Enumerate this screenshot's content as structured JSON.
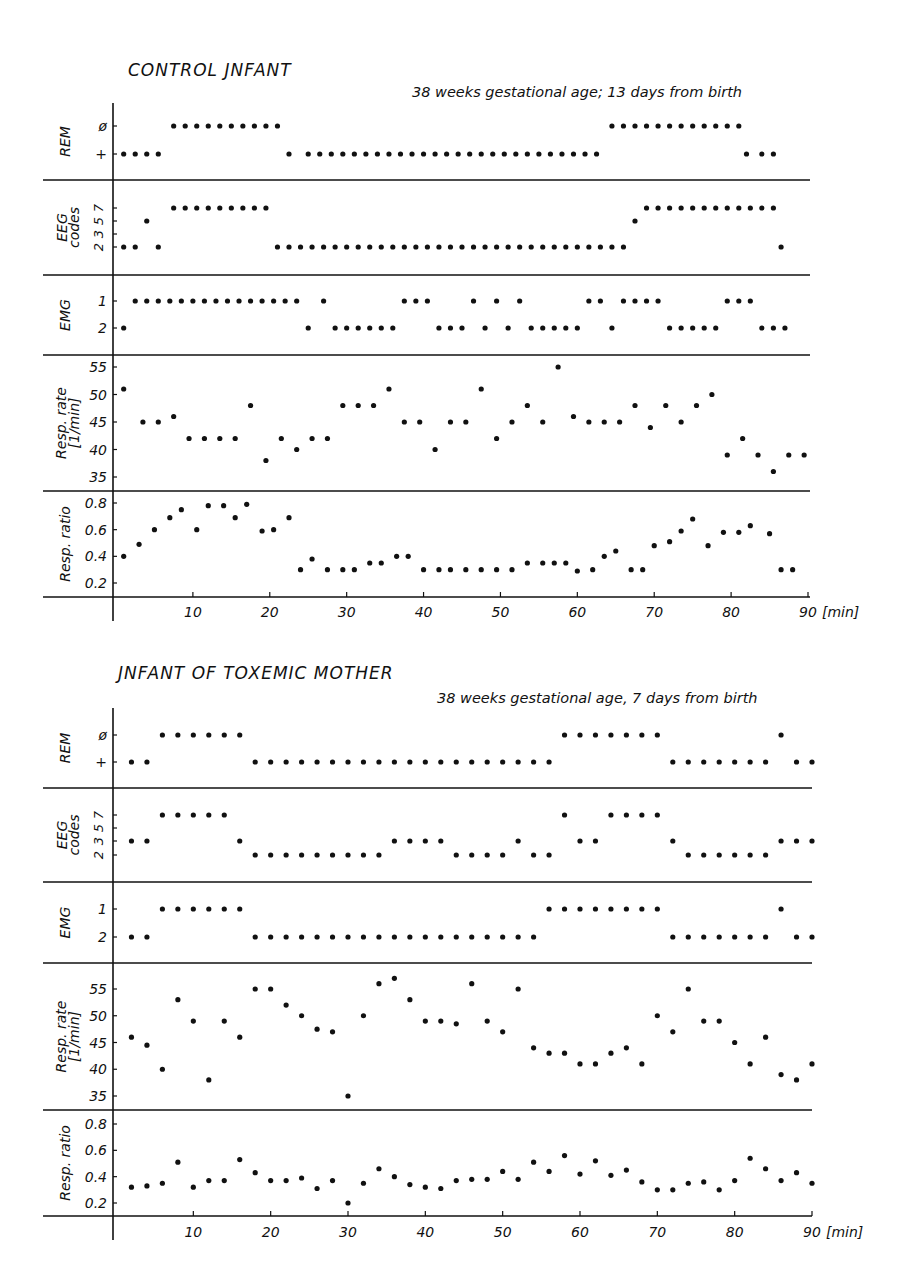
{
  "figure": {
    "top": {
      "title": "CONTROL JNFANT",
      "subtitle": "38 weeks gestational age; 13 days from birth"
    },
    "bottom": {
      "title": "JNFANT OF TOXEMIC MOTHER",
      "subtitle": "38 weeks gestational age, 7 days from birth"
    }
  },
  "chart_data": [
    {
      "type": "scatter",
      "title": "CONTROL JNFANT",
      "subtitle": "38 weeks gestational age; 13 days from birth",
      "xlabel": "[min]",
      "xlim": [
        0,
        90
      ],
      "xticks": [
        10,
        20,
        30,
        40,
        50,
        60,
        70,
        80,
        90
      ],
      "grid": false,
      "panels": [
        {
          "name": "REM",
          "ylabel": "REM",
          "yticks": [
            "+",
            "ø"
          ],
          "x": [
            1,
            2.5,
            4,
            5.5,
            7.5,
            9,
            10.5,
            12,
            13.5,
            15,
            16.5,
            18,
            19.5,
            21,
            22.5,
            25,
            26.5,
            28,
            29.5,
            31,
            32.5,
            34,
            35.5,
            37,
            38.5,
            40,
            41.5,
            43,
            44.5,
            46,
            47.5,
            49,
            50.5,
            52,
            53.5,
            55,
            56.5,
            58,
            59.5,
            61,
            62.5,
            64.5,
            66,
            67.5,
            69,
            70.5,
            72,
            73.5,
            75,
            76.5,
            78,
            79.5,
            81,
            82,
            84,
            85.5
          ],
          "values": [
            "+",
            "+",
            "+",
            "+",
            "ø",
            "ø",
            "ø",
            "ø",
            "ø",
            "ø",
            "ø",
            "ø",
            "ø",
            "ø",
            "+",
            "+",
            "+",
            "+",
            "+",
            "+",
            "+",
            "+",
            "+",
            "+",
            "+",
            "+",
            "+",
            "+",
            "+",
            "+",
            "+",
            "+",
            "+",
            "+",
            "+",
            "+",
            "+",
            "+",
            "+",
            "+",
            "+",
            "ø",
            "ø",
            "ø",
            "ø",
            "ø",
            "ø",
            "ø",
            "ø",
            "ø",
            "ø",
            "ø",
            "ø",
            "+",
            "+",
            "+"
          ]
        },
        {
          "name": "EEG codes",
          "ylabel": "EEG codes",
          "yticks": [
            "2",
            "3",
            "5",
            "7"
          ],
          "x": [
            1,
            2.5,
            4,
            5.5,
            7.5,
            9,
            10.5,
            12,
            13.5,
            15,
            16.5,
            18,
            19.5,
            21,
            22.5,
            24,
            25.5,
            27,
            28.5,
            30,
            31.5,
            33,
            34.5,
            36,
            37.5,
            39,
            40.5,
            42,
            43.5,
            45,
            46.5,
            48,
            49.5,
            51,
            52.5,
            54,
            55.5,
            57,
            58.5,
            60,
            61.5,
            63,
            64.5,
            66,
            67.5,
            69,
            70.5,
            72,
            73.5,
            75,
            76.5,
            78,
            79.5,
            81,
            82.5,
            84,
            85.5,
            86.5
          ],
          "values": [
            2,
            2,
            5,
            2,
            7,
            7,
            7,
            7,
            7,
            7,
            7,
            7,
            7,
            2,
            2,
            2,
            2,
            2,
            2,
            2,
            2,
            2,
            2,
            2,
            2,
            2,
            2,
            2,
            2,
            2,
            2,
            2,
            2,
            2,
            2,
            2,
            2,
            2,
            2,
            2,
            2,
            2,
            2,
            2,
            5,
            7,
            7,
            7,
            7,
            7,
            7,
            7,
            7,
            7,
            7,
            7,
            7,
            2
          ]
        },
        {
          "name": "EMG",
          "ylabel": "EMG",
          "yticks": [
            "2",
            "1"
          ],
          "x": [
            1,
            2.5,
            4,
            5.5,
            7,
            8.5,
            10,
            11.5,
            13,
            14.5,
            16,
            17.5,
            19,
            20.5,
            22,
            23.5,
            25,
            27,
            28.5,
            30,
            31.5,
            33,
            34.5,
            36,
            37.5,
            39,
            40.5,
            42,
            43.5,
            45,
            46.5,
            48,
            49.5,
            51,
            52.5,
            54,
            55.5,
            57,
            58.5,
            60,
            61.5,
            63,
            64.5,
            66,
            67.5,
            69,
            70.5,
            72,
            73.5,
            75,
            76.5,
            78,
            79.5,
            81,
            82.5,
            84,
            85.5,
            87
          ],
          "values": [
            2,
            1,
            1,
            1,
            1,
            1,
            1,
            1,
            1,
            1,
            1,
            1,
            1,
            1,
            1,
            1,
            2,
            1,
            2,
            2,
            2,
            2,
            2,
            2,
            1,
            1,
            1,
            2,
            2,
            2,
            1,
            2,
            1,
            2,
            1,
            2,
            2,
            2,
            2,
            2,
            1,
            1,
            2,
            1,
            1,
            1,
            1,
            2,
            2,
            2,
            2,
            2,
            1,
            1,
            1,
            2,
            2,
            2
          ]
        },
        {
          "name": "Resp. rate",
          "ylabel": "Resp. rate [1/min]",
          "ylim": [
            33,
            57
          ],
          "yticks": [
            35,
            40,
            45,
            50,
            55
          ],
          "x": [
            1,
            3.5,
            5.5,
            7.5,
            9.5,
            11.5,
            13.5,
            15.5,
            17.5,
            19.5,
            21.5,
            23.5,
            25.5,
            27.5,
            29.5,
            31.5,
            33.5,
            35.5,
            37.5,
            39.5,
            41.5,
            43.5,
            45.5,
            47.5,
            49.5,
            51.5,
            53.5,
            55.5,
            57.5,
            59.5,
            61.5,
            63.5,
            65.5,
            67.5,
            69.5,
            71.5,
            73.5,
            75.5,
            77.5,
            79.5,
            81.5,
            83.5,
            85.5,
            87.5,
            89.5
          ],
          "values": [
            51,
            45,
            45,
            46,
            42,
            42,
            42,
            42,
            48,
            38,
            42,
            40,
            42,
            42,
            48,
            48,
            48,
            51,
            45,
            45,
            40,
            45,
            45,
            51,
            42,
            45,
            48,
            45,
            55,
            46,
            45,
            45,
            45,
            48,
            44,
            48,
            45,
            48,
            50,
            39,
            42,
            39,
            36,
            39,
            39
          ]
        },
        {
          "name": "Resp. ratio",
          "ylabel": "Resp. ratio",
          "ylim": [
            0.1,
            0.9
          ],
          "yticks": [
            0.2,
            0.4,
            0.6,
            0.8
          ],
          "x": [
            1,
            3,
            5,
            7,
            8.5,
            10.5,
            12,
            14,
            15.5,
            17,
            19,
            20.5,
            22.5,
            24,
            25.5,
            27.5,
            29.5,
            31,
            33,
            34.5,
            36.5,
            38,
            40,
            42,
            43.5,
            45.5,
            47.5,
            49.5,
            51.5,
            53.5,
            55.5,
            57,
            58.5,
            60,
            62,
            63.5,
            65,
            67,
            68.5,
            70,
            72,
            73.5,
            75,
            77,
            79,
            81,
            82.5,
            85,
            86.5,
            88
          ],
          "values": [
            0.4,
            0.49,
            0.6,
            0.69,
            0.75,
            0.6,
            0.78,
            0.78,
            0.69,
            0.79,
            0.59,
            0.6,
            0.69,
            0.3,
            0.38,
            0.3,
            0.3,
            0.3,
            0.35,
            0.35,
            0.4,
            0.4,
            0.3,
            0.3,
            0.3,
            0.3,
            0.3,
            0.3,
            0.3,
            0.35,
            0.35,
            0.35,
            0.35,
            0.29,
            0.3,
            0.4,
            0.44,
            0.3,
            0.3,
            0.48,
            0.51,
            0.59,
            0.68,
            0.48,
            0.58,
            0.58,
            0.63,
            0.57,
            0.3,
            0.3
          ]
        }
      ]
    },
    {
      "type": "scatter",
      "title": "JNFANT OF TOXEMIC MOTHER",
      "subtitle": "38 weeks gestational age, 7 days from birth",
      "xlabel": "[min]",
      "xlim": [
        0,
        90
      ],
      "xticks": [
        10,
        20,
        30,
        40,
        50,
        60,
        70,
        80,
        90
      ],
      "grid": false,
      "panels": [
        {
          "name": "REM",
          "ylabel": "REM",
          "yticks": [
            "+",
            "ø"
          ],
          "x": [
            2,
            4,
            6,
            8,
            10,
            12,
            14,
            16,
            18,
            20,
            22,
            24,
            26,
            28,
            30,
            32,
            34,
            36,
            38,
            40,
            42,
            44,
            46,
            48,
            50,
            52,
            54,
            56,
            58,
            60,
            62,
            64,
            66,
            68,
            70,
            72,
            74,
            76,
            78,
            80,
            82,
            84,
            86,
            88,
            90
          ],
          "values": [
            "+",
            "+",
            "ø",
            "ø",
            "ø",
            "ø",
            "ø",
            "ø",
            "+",
            "+",
            "+",
            "+",
            "+",
            "+",
            "+",
            "+",
            "+",
            "+",
            "+",
            "+",
            "+",
            "+",
            "+",
            "+",
            "+",
            "+",
            "+",
            "+",
            "ø",
            "ø",
            "ø",
            "ø",
            "ø",
            "ø",
            "ø",
            "+",
            "+",
            "+",
            "+",
            "+",
            "+",
            "+",
            "ø",
            "+",
            "+"
          ]
        },
        {
          "name": "EEG codes",
          "ylabel": "EEG codes",
          "yticks": [
            "2",
            "3",
            "5",
            "7"
          ],
          "x": [
            2,
            4,
            6,
            8,
            10,
            12,
            14,
            16,
            18,
            20,
            22,
            24,
            26,
            28,
            30,
            32,
            34,
            36,
            38,
            40,
            42,
            44,
            46,
            48,
            50,
            52,
            54,
            56,
            58,
            60,
            62,
            64,
            66,
            68,
            70,
            72,
            74,
            76,
            78,
            80,
            82,
            84,
            86,
            88,
            90
          ],
          "values": [
            3,
            3,
            7,
            7,
            7,
            7,
            7,
            3,
            2,
            2,
            2,
            2,
            2,
            2,
            2,
            2,
            2,
            3,
            3,
            3,
            3,
            2,
            2,
            2,
            2,
            3,
            2,
            2,
            7,
            3,
            3,
            7,
            7,
            7,
            7,
            3,
            2,
            2,
            2,
            2,
            2,
            2,
            3,
            3,
            3
          ]
        },
        {
          "name": "EMG",
          "ylabel": "EMG",
          "yticks": [
            "2",
            "1"
          ],
          "x": [
            2,
            4,
            6,
            8,
            10,
            12,
            14,
            16,
            18,
            20,
            22,
            24,
            26,
            28,
            30,
            32,
            34,
            36,
            38,
            40,
            42,
            44,
            46,
            48,
            50,
            52,
            54,
            56,
            58,
            60,
            62,
            64,
            66,
            68,
            70,
            72,
            74,
            76,
            78,
            80,
            82,
            84,
            86,
            88,
            90
          ],
          "values": [
            2,
            2,
            1,
            1,
            1,
            1,
            1,
            1,
            2,
            2,
            2,
            2,
            2,
            2,
            2,
            2,
            2,
            2,
            2,
            2,
            2,
            2,
            2,
            2,
            2,
            2,
            2,
            1,
            1,
            1,
            1,
            1,
            1,
            1,
            1,
            2,
            2,
            2,
            2,
            2,
            2,
            2,
            1,
            2,
            2
          ]
        },
        {
          "name": "Resp. rate",
          "ylabel": "Resp. rate [1/min]",
          "ylim": [
            33,
            60
          ],
          "yticks": [
            35,
            40,
            45,
            50,
            55
          ],
          "x": [
            2,
            4,
            6,
            8,
            10,
            12,
            14,
            16,
            18,
            20,
            22,
            24,
            26,
            28,
            30,
            32,
            34,
            36,
            38,
            40,
            42,
            44,
            46,
            48,
            50,
            52,
            54,
            56,
            58,
            60,
            62,
            64,
            66,
            68,
            70,
            72,
            74,
            76,
            78,
            80,
            82,
            84,
            86,
            88,
            90
          ],
          "values": [
            46,
            44.5,
            40,
            53,
            49,
            38,
            49,
            46,
            55,
            55,
            52,
            50,
            47.5,
            47,
            35,
            50,
            56,
            57,
            53,
            49,
            49,
            48.5,
            56,
            49,
            47,
            55,
            44,
            43,
            43,
            41,
            41,
            43,
            44,
            41,
            50,
            47,
            55,
            49,
            49,
            45,
            41,
            46,
            39,
            38,
            41
          ]
        },
        {
          "name": "Resp. ratio",
          "ylabel": "Resp. ratio",
          "ylim": [
            0.1,
            0.9
          ],
          "yticks": [
            0.2,
            0.4,
            0.6,
            0.8
          ],
          "x": [
            2,
            4,
            6,
            8,
            10,
            12,
            14,
            16,
            18,
            20,
            22,
            24,
            26,
            28,
            30,
            32,
            34,
            36,
            38,
            40,
            42,
            44,
            46,
            48,
            50,
            52,
            54,
            56,
            58,
            60,
            62,
            64,
            66,
            68,
            70,
            72,
            74,
            76,
            78,
            80,
            82,
            84,
            86,
            88,
            90
          ],
          "values": [
            0.32,
            0.33,
            0.35,
            0.51,
            0.32,
            0.37,
            0.37,
            0.53,
            0.43,
            0.37,
            0.37,
            0.39,
            0.31,
            0.37,
            0.2,
            0.35,
            0.46,
            0.4,
            0.34,
            0.32,
            0.31,
            0.37,
            0.38,
            0.38,
            0.44,
            0.38,
            0.51,
            0.44,
            0.56,
            0.42,
            0.52,
            0.41,
            0.45,
            0.36,
            0.3,
            0.3,
            0.35,
            0.36,
            0.3,
            0.37,
            0.54,
            0.46,
            0.37,
            0.43,
            0.35
          ]
        }
      ]
    }
  ]
}
